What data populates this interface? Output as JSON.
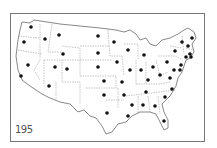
{
  "figure": {
    "label": "195",
    "colors": {
      "frame": "#777777",
      "outline": "#555555",
      "border": "#888888",
      "dot": "#111111",
      "background": "#ffffff"
    }
  },
  "map": {
    "subject": "United States (contiguous) with one dot per state",
    "dots": [
      {
        "state": "WA",
        "x": 31,
        "y": 27
      },
      {
        "state": "OR",
        "x": 24,
        "y": 42
      },
      {
        "state": "ID",
        "x": 45,
        "y": 39
      },
      {
        "state": "MT",
        "x": 59,
        "y": 35
      },
      {
        "state": "WY",
        "x": 63,
        "y": 54
      },
      {
        "state": "NV",
        "x": 28,
        "y": 65
      },
      {
        "state": "UT",
        "x": 55,
        "y": 67
      },
      {
        "state": "CO",
        "x": 67,
        "y": 69
      },
      {
        "state": "CA",
        "x": 21,
        "y": 76
      },
      {
        "state": "AZ",
        "x": 49,
        "y": 86
      },
      {
        "state": "ND",
        "x": 98,
        "y": 36
      },
      {
        "state": "MN",
        "x": 114,
        "y": 42
      },
      {
        "state": "SD",
        "x": 98,
        "y": 53
      },
      {
        "state": "WI",
        "x": 128,
        "y": 50
      },
      {
        "state": "MI",
        "x": 144,
        "y": 55
      },
      {
        "state": "NE",
        "x": 98,
        "y": 67
      },
      {
        "state": "IA",
        "x": 117,
        "y": 62
      },
      {
        "state": "IL",
        "x": 130,
        "y": 70
      },
      {
        "state": "IN",
        "x": 141,
        "y": 70
      },
      {
        "state": "OH",
        "x": 153,
        "y": 67
      },
      {
        "state": "KS",
        "x": 104,
        "y": 81
      },
      {
        "state": "MO",
        "x": 122,
        "y": 82
      },
      {
        "state": "KY",
        "x": 148,
        "y": 80
      },
      {
        "state": "OK",
        "x": 104,
        "y": 95
      },
      {
        "state": "AR",
        "x": 124,
        "y": 95
      },
      {
        "state": "TN",
        "x": 146,
        "y": 92
      },
      {
        "state": "TX",
        "x": 107,
        "y": 113
      },
      {
        "state": "LA",
        "x": 128,
        "y": 116
      },
      {
        "state": "MS",
        "x": 132,
        "y": 105
      },
      {
        "state": "AL",
        "x": 143,
        "y": 105
      },
      {
        "state": "GA",
        "x": 155,
        "y": 106
      },
      {
        "state": "SC",
        "x": 165,
        "y": 97
      },
      {
        "state": "NC",
        "x": 172,
        "y": 89
      },
      {
        "state": "FL",
        "x": 164,
        "y": 121
      },
      {
        "state": "VA",
        "x": 170,
        "y": 78
      },
      {
        "state": "WV",
        "x": 160,
        "y": 75
      },
      {
        "state": "PA",
        "x": 167,
        "y": 62
      },
      {
        "state": "NY",
        "x": 175,
        "y": 51
      },
      {
        "state": "VT",
        "x": 182,
        "y": 42
      },
      {
        "state": "NH",
        "x": 188,
        "y": 46
      },
      {
        "state": "ME",
        "x": 192,
        "y": 38
      },
      {
        "state": "MA",
        "x": 190,
        "y": 54
      },
      {
        "state": "CT",
        "x": 186,
        "y": 57
      },
      {
        "state": "RI",
        "x": 191,
        "y": 57
      },
      {
        "state": "NJ",
        "x": 181,
        "y": 65
      },
      {
        "state": "DE",
        "x": 180,
        "y": 70
      },
      {
        "state": "MD",
        "x": 174,
        "y": 70
      }
    ]
  }
}
